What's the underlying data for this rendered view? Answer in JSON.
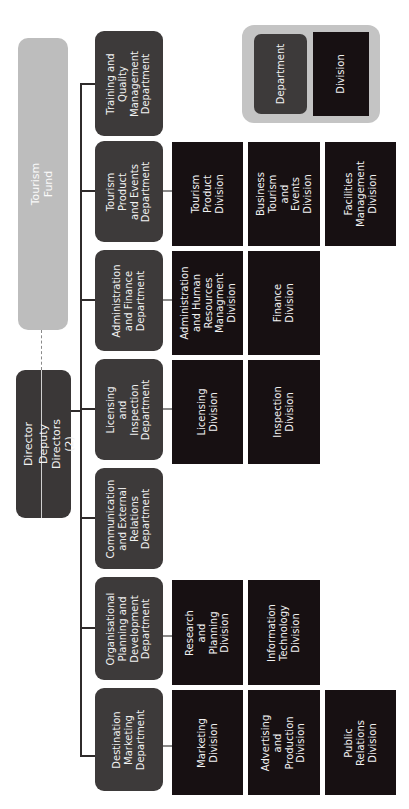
{
  "chart_title": "",
  "tourism_fund": {
    "label": "Tourism Fund"
  },
  "leadership": {
    "director": "Director",
    "deputy": "Deputy Directors (2)"
  },
  "legend": {
    "department": "Department",
    "division": "Division"
  },
  "colors": {
    "department": "#3d3a3a",
    "division": "#171012",
    "fund": "#bdbdbd",
    "legend_bg": "#c4c4c4"
  },
  "departments": [
    {
      "label": "Training and\nQuality\nManagement\nDepartment",
      "divisions": []
    },
    {
      "label": "Tourism Product\nand Events\nDepartment",
      "divisions": [
        "Tourism\nProduct\nDivision",
        "Business\nTourism and\nEvents\nDivision",
        "Facilities\nManagement\nDivision"
      ]
    },
    {
      "label": "Administration\nand Finance\nDepartment",
      "divisions": [
        "Administration\nand Human\nResources\nManagment\nDivision",
        "Finance\nDivision"
      ]
    },
    {
      "label": "Licensing and\nInspection\nDepartment",
      "divisions": [
        "Licensing\nDivision",
        "Inspection\nDivision"
      ]
    },
    {
      "label": "Communication\nand External\nRelations\nDepartment",
      "divisions": []
    },
    {
      "label": "Organisational\nPlanning and\nDevelopment\nDepartment",
      "divisions": [
        "Research\nand Planning\nDivision",
        "Information\nTechnology\nDivision"
      ]
    },
    {
      "label": "Destination\nMarketing\nDepartment",
      "divisions": [
        "Marketing\nDivision",
        "Advertising and\nProduction\nDivision",
        "Public\nRelations\nDivision"
      ]
    }
  ]
}
